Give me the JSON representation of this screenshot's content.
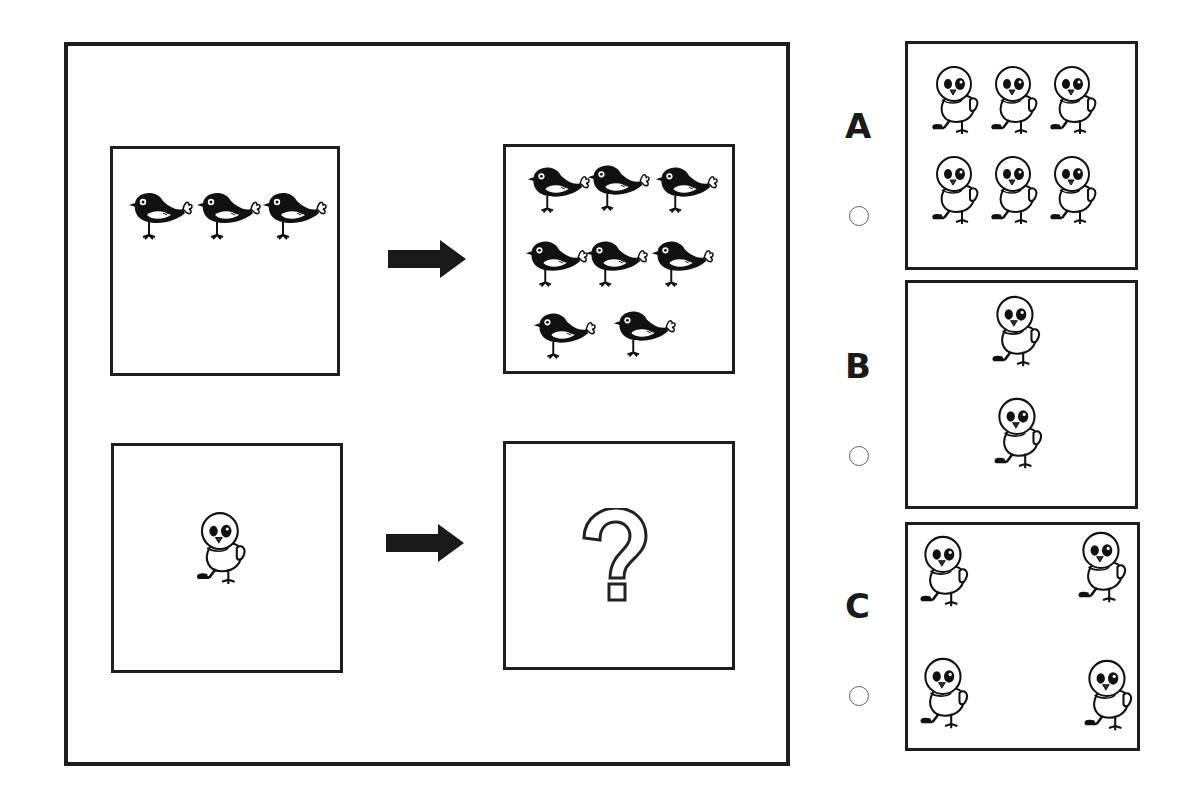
{
  "puzzle": {
    "example": {
      "source": {
        "item": "black-bird",
        "count": 3
      },
      "result": {
        "item": "black-bird",
        "count": 8
      }
    },
    "question": {
      "source": {
        "item": "chick",
        "count": 1
      },
      "result": {
        "symbol": "?"
      }
    }
  },
  "options": [
    {
      "label": "A",
      "item": "chick",
      "count": 6,
      "selected": false
    },
    {
      "label": "B",
      "item": "chick",
      "count": 2,
      "selected": false
    },
    {
      "label": "C",
      "item": "chick",
      "count": 4,
      "selected": false
    }
  ],
  "colors": {
    "border": "#1e1e1e",
    "bird": "#111111",
    "background": "#ffffff"
  }
}
